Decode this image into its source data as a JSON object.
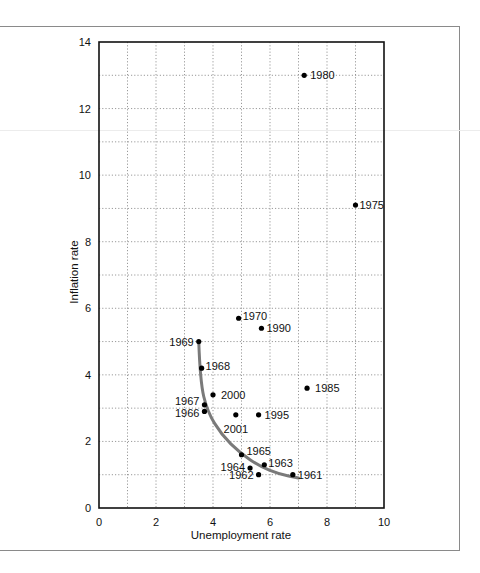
{
  "chart_data": {
    "type": "scatter",
    "title": "",
    "xlabel": "Unemployment rate",
    "ylabel": "Inflation rate",
    "xlim": [
      0,
      10
    ],
    "ylim": [
      0,
      14
    ],
    "x_ticks": [
      "0",
      "2",
      "4",
      "6",
      "8",
      "10"
    ],
    "y_ticks": [
      "0",
      "2",
      "4",
      "6",
      "8",
      "10",
      "12",
      "14"
    ],
    "grid": "dotted, every 1 unit",
    "points": [
      {
        "label": "1961",
        "x": 6.8,
        "y": 1.0
      },
      {
        "label": "1962",
        "x": 5.6,
        "y": 1.0
      },
      {
        "label": "1963",
        "x": 5.8,
        "y": 1.3
      },
      {
        "label": "1964",
        "x": 5.3,
        "y": 1.2
      },
      {
        "label": "1965",
        "x": 5.0,
        "y": 1.6
      },
      {
        "label": "1966",
        "x": 3.7,
        "y": 2.9
      },
      {
        "label": "1967",
        "x": 3.7,
        "y": 3.1
      },
      {
        "label": "1968",
        "x": 3.6,
        "y": 4.2
      },
      {
        "label": "1969",
        "x": 3.5,
        "y": 5.0
      },
      {
        "label": "1970",
        "x": 4.9,
        "y": 5.7
      },
      {
        "label": "1975",
        "x": 9.0,
        "y": 9.1
      },
      {
        "label": "1980",
        "x": 7.2,
        "y": 13.0
      },
      {
        "label": "1985",
        "x": 7.3,
        "y": 3.6
      },
      {
        "label": "1990",
        "x": 5.7,
        "y": 5.4
      },
      {
        "label": "1995",
        "x": 5.6,
        "y": 2.8
      },
      {
        "label": "2000",
        "x": 4.0,
        "y": 3.4
      },
      {
        "label": "2001",
        "x": 4.8,
        "y": 2.8
      }
    ],
    "curve": {
      "description": "Phillips curve fitted through 1961-1969",
      "color": "#7a7a7a",
      "points": [
        [
          3.5,
          5.0
        ],
        [
          3.55,
          3.8
        ],
        [
          3.8,
          2.9
        ],
        [
          4.3,
          2.2
        ],
        [
          4.95,
          1.65
        ],
        [
          5.65,
          1.25
        ],
        [
          6.3,
          1.02
        ],
        [
          7.0,
          0.9
        ]
      ]
    },
    "legend": null
  },
  "labels": {
    "x_axis": "Unemployment rate",
    "y_axis": "Inflation rate"
  },
  "colors": {
    "curve": "#7a7a7a",
    "points": "#000000",
    "grid": "#9a9a9a",
    "axis": "#111111"
  }
}
